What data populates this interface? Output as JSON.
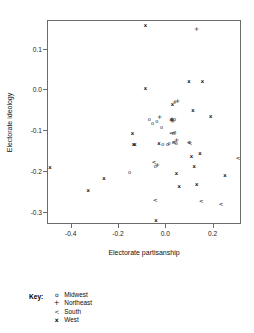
{
  "chart_data": {
    "type": "scatter",
    "title": "",
    "xlabel": "Electorate partisanship",
    "ylabel": "Electorate ideology",
    "xlim": [
      -0.5,
      0.32
    ],
    "ylim": [
      -0.33,
      0.17
    ],
    "xticks": [
      -0.4,
      -0.2,
      0.0,
      0.2
    ],
    "xticklabels": [
      "-0.4",
      "-0.2",
      "0.0",
      "0.2"
    ],
    "yticks": [
      0.1,
      0.0,
      -0.1,
      -0.2,
      -0.3
    ],
    "yticklabels": [
      "0.1",
      "0.0",
      "-0.1",
      "-0.2",
      "-0.3"
    ],
    "grid": false,
    "legend_position": "below-plot",
    "series": [
      {
        "name": "Midwest",
        "marker": "o",
        "points": [
          [
            -0.155,
            -0.199
          ],
          [
            -0.072,
            -0.07
          ],
          [
            -0.058,
            -0.079
          ],
          [
            -0.04,
            -0.076
          ],
          [
            -0.02,
            -0.089
          ],
          [
            -0.015,
            -0.132
          ],
          [
            0.005,
            -0.131
          ],
          [
            0.012,
            -0.128
          ],
          [
            0.03,
            -0.126
          ],
          [
            0.035,
            -0.071
          ],
          [
            0.036,
            -0.103
          ],
          [
            0.042,
            -0.13
          ],
          [
            -0.047,
            -0.185
          ],
          [
            0.022,
            -0.069
          ]
        ]
      },
      {
        "name": "Northeast",
        "marker": "+",
        "points": [
          [
            0.128,
            0.15
          ],
          [
            -0.038,
            -0.183
          ],
          [
            0.036,
            -0.028
          ],
          [
            0.048,
            -0.026
          ],
          [
            -0.028,
            -0.065
          ],
          [
            0.02,
            -0.073
          ],
          [
            0.024,
            -0.07
          ],
          [
            0.028,
            -0.075
          ],
          [
            0.044,
            -0.122
          ]
        ]
      },
      {
        "name": "South",
        "marker": "<",
        "points": [
          [
            -0.052,
            -0.178
          ],
          [
            -0.046,
            -0.271
          ],
          [
            0.021,
            -0.108
          ],
          [
            0.031,
            -0.107
          ],
          [
            0.096,
            -0.13
          ],
          [
            0.148,
            -0.274
          ],
          [
            0.232,
            -0.281
          ],
          [
            0.304,
            -0.167
          ],
          [
            0.034,
            -0.128
          ],
          [
            0.1,
            -0.131
          ]
        ]
      },
      {
        "name": "West",
        "marker": "x",
        "points": [
          [
            -0.492,
            -0.19
          ],
          [
            -0.33,
            -0.247
          ],
          [
            -0.264,
            -0.217
          ],
          [
            -0.143,
            -0.106
          ],
          [
            -0.139,
            -0.135
          ],
          [
            -0.132,
            -0.133
          ],
          [
            -0.088,
            0.158
          ],
          [
            -0.088,
            0.004
          ],
          [
            -0.031,
            -0.132
          ],
          [
            0.026,
            -0.037
          ],
          [
            0.096,
            0.02
          ],
          [
            0.153,
            0.021
          ],
          [
            0.113,
            -0.05
          ],
          [
            0.188,
            -0.066
          ],
          [
            0.106,
            -0.164
          ],
          [
            0.142,
            -0.157
          ],
          [
            0.118,
            -0.187
          ],
          [
            0.043,
            -0.205
          ],
          [
            0.054,
            -0.236
          ],
          [
            0.128,
            -0.231
          ],
          [
            0.248,
            -0.211
          ],
          [
            -0.044,
            -0.319
          ]
        ]
      }
    ]
  },
  "legend": {
    "title": "Key:",
    "entries": [
      {
        "symbol": "o",
        "label": "Midwest"
      },
      {
        "symbol": "+",
        "label": "Northeast"
      },
      {
        "symbol": "<",
        "label": "South"
      },
      {
        "symbol": "x",
        "label": "West"
      }
    ]
  }
}
